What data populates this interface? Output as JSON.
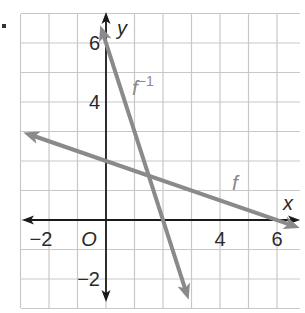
{
  "chart_data": {
    "type": "line",
    "title": "",
    "xlabel": "x",
    "ylabel": "y",
    "origin_label": "O",
    "xlim": [
      -3,
      7
    ],
    "ylim": [
      -3,
      7
    ],
    "grid": true,
    "x_tick_labels": [
      {
        "value": -2,
        "label": "−2"
      },
      {
        "value": 4,
        "label": "4"
      },
      {
        "value": 6,
        "label": "6"
      }
    ],
    "y_tick_labels": [
      {
        "value": 6,
        "label": "6"
      },
      {
        "value": 4,
        "label": "4"
      },
      {
        "value": -2,
        "label": "−2"
      }
    ],
    "series": [
      {
        "name": "f",
        "label": "f",
        "equation": "f(x) = 2 - x/3",
        "x": [
          -2.9,
          0,
          6,
          6.8
        ],
        "y": [
          2.97,
          2,
          0,
          -0.27
        ],
        "arrows": "both",
        "color": "#8a8a8a"
      },
      {
        "name": "f_inverse",
        "label": "f",
        "superscript": "−1",
        "equation": "f^-1(x) = 6 - 3x",
        "x": [
          -0.2,
          0,
          2,
          2.9
        ],
        "y": [
          6.6,
          6,
          0,
          -2.7
        ],
        "arrows": "both",
        "color": "#8a8a8a"
      }
    ],
    "colors": {
      "grid": "#c8c8c8",
      "axes": "#1a1a1a",
      "lines": "#8a8a8a",
      "text": "#2a2a2a",
      "line_label": "#8a8a8a"
    }
  }
}
